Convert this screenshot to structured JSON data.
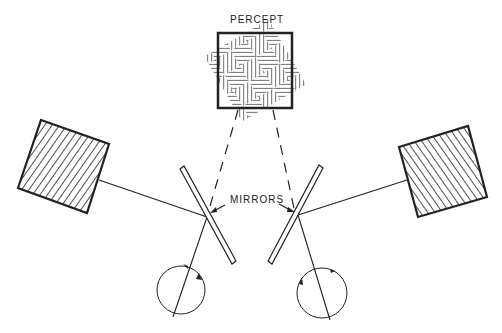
{
  "diagram": {
    "labels": {
      "percept": "PERCEPT",
      "mirrors": "MIRRORS"
    },
    "elements": {
      "percept_pattern": "basket-weave hatch",
      "left_stimulus_pattern": "diagonal hatch",
      "right_stimulus_pattern": "diagonal hatch",
      "connectors": "dashed lines from percept to mirrors"
    },
    "colors": {
      "ink": "#222222",
      "background": "#ffffff"
    }
  }
}
